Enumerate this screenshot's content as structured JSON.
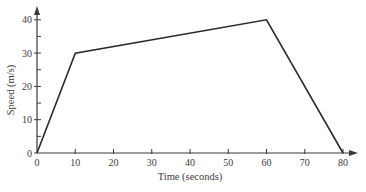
{
  "chart_data": {
    "type": "line",
    "title": "",
    "xlabel": "Time (seconds)",
    "ylabel": "Speed (m/s)",
    "x": [
      0,
      10,
      60,
      80
    ],
    "series": [
      {
        "name": "speed",
        "values": [
          0,
          30,
          40,
          0
        ]
      }
    ],
    "xlim": [
      0,
      80
    ],
    "ylim": [
      0,
      40
    ],
    "xticks": [
      0,
      10,
      20,
      30,
      40,
      50,
      60,
      70,
      80
    ],
    "yticks": [
      0,
      10,
      20,
      30,
      40
    ],
    "y_minor_step": 5,
    "grid": false,
    "legend": "none"
  },
  "labels": {
    "x_axis": "Time (seconds)",
    "y_axis": "Speed (m/s)"
  },
  "colors": {
    "line": "#2a2a2a",
    "axis": "#3a3a3a",
    "text": "#3a3a3a"
  }
}
